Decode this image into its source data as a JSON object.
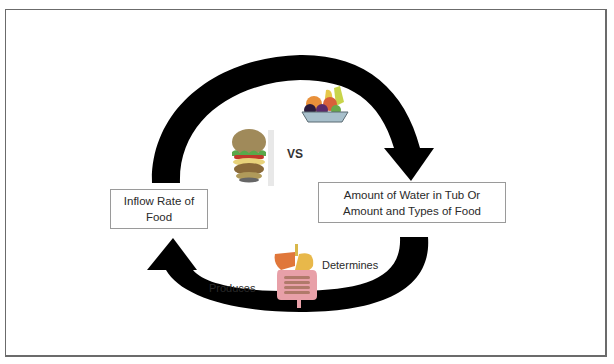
{
  "diagram": {
    "type": "cycle",
    "nodes": [
      {
        "id": "inflow",
        "label": "Inflow Rate of Food"
      },
      {
        "id": "stock",
        "label": "Amount of Water in Tub Or Amount and Types of Food"
      }
    ],
    "edge_labels": {
      "comparison": "VS",
      "produces": "Produces",
      "determines": "Determines"
    },
    "icons": [
      "hamburger-icon",
      "fruit-bowl-icon",
      "digestive-system-icon"
    ],
    "colors": {
      "arrow": "#000000",
      "box_border": "#9a9a9a",
      "frame_border": "#6b6b6b",
      "text": "#2a2a2a"
    }
  }
}
